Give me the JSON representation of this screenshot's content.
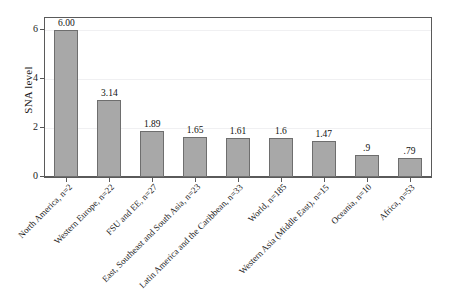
{
  "chart_data": {
    "type": "bar",
    "title": "",
    "xlabel": "",
    "ylabel": "SNA level",
    "ylim": [
      0,
      6.5
    ],
    "yticks": [
      "0",
      "2",
      "4",
      "6"
    ],
    "ytick_values": [
      0,
      2,
      4,
      6
    ],
    "grid": true,
    "legend": "none",
    "orientation": "vertical",
    "bar_color": "#a8a8a8",
    "bar_border_color": "#6e6e6e",
    "label_rotation_deg": -45,
    "categories": [
      "North America, n=2",
      "Western Europe, n=22",
      "FSU and EE, n=27",
      "East, Southeast and South Asia, n=23",
      "Latin America and the Caribbean, n=33",
      "World, n=185",
      "Western Asia (Middle East), n=15",
      "Oceania, n=10",
      "Africa, n=53"
    ],
    "values": [
      6.0,
      3.14,
      1.89,
      1.65,
      1.61,
      1.6,
      1.47,
      0.9,
      0.79
    ],
    "value_labels": [
      "6.00",
      "3.14",
      "1.89",
      "1.65",
      "1.61",
      "1.6",
      "1.47",
      ".9",
      ".79"
    ]
  }
}
